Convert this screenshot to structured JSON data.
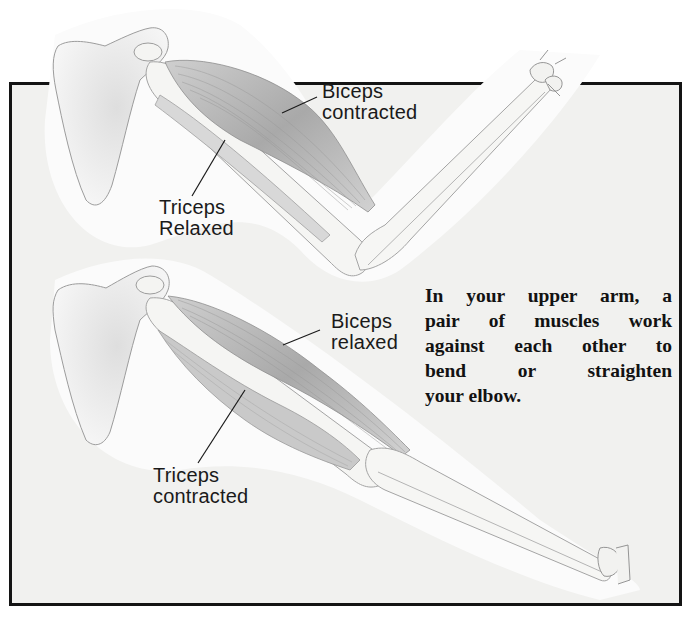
{
  "diagram": {
    "type": "anatomical-illustration",
    "panels": [
      {
        "name": "flexed-arm",
        "labels": [
          {
            "id": "biceps_contracted",
            "line1": "Biceps",
            "line2": "contracted"
          },
          {
            "id": "triceps_relaxed",
            "line1": "Triceps",
            "line2": "Relaxed"
          }
        ]
      },
      {
        "name": "extended-arm",
        "labels": [
          {
            "id": "biceps_relaxed",
            "line1": "Biceps",
            "line2": "relaxed"
          },
          {
            "id": "triceps_contracted",
            "line1": "Triceps",
            "line2": "contracted"
          }
        ]
      }
    ],
    "caption_lines": [
      "In your upper arm, a",
      "pair of muscles work",
      "against each other to",
      "bend or straighten",
      "your elbow."
    ]
  },
  "colors": {
    "frame_border": "#141414",
    "panel_background": "#f1f1ef",
    "bone": "#f7f7f5",
    "muscle": "#b8b8b8",
    "outline": "#9a9a9a",
    "text": "#1a1a1a"
  }
}
